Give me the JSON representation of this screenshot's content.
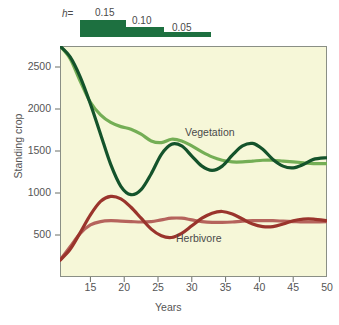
{
  "legend": {
    "h_prefix": "h",
    "equals": "=",
    "values": [
      "0.15",
      "0.10",
      "0.05"
    ],
    "bar_color": "#1d7040"
  },
  "chart_data": {
    "type": "line",
    "title": "",
    "xlabel": "Years",
    "ylabel": "Standing crop",
    "xlim": [
      10.5,
      50
    ],
    "ylim": [
      0,
      2750
    ],
    "xticks": [
      15,
      20,
      25,
      30,
      35,
      40,
      45,
      50
    ],
    "yticks": [
      500,
      1000,
      1500,
      2000,
      2500
    ],
    "grid": false,
    "legend_position": "inline-annotation",
    "plot_background": "#f6f7d8",
    "annotations": [
      {
        "text": "Vegetation",
        "x": 32,
        "y": 1700
      },
      {
        "text": "Herbivore",
        "x": 30,
        "y": 430
      }
    ],
    "series": [
      {
        "name": "Vegetation h=0.05",
        "color": "#14532b",
        "x": [
          10.5,
          12,
          13.5,
          15,
          16.5,
          18,
          19.5,
          21,
          22.5,
          24,
          25.5,
          27,
          28.5,
          30,
          31.5,
          33,
          34.5,
          36,
          37.5,
          39,
          40.5,
          42,
          43.5,
          45,
          46.5,
          48,
          50
        ],
        "values": [
          2750,
          2620,
          2380,
          2060,
          1700,
          1340,
          1080,
          980,
          1040,
          1230,
          1460,
          1580,
          1560,
          1440,
          1320,
          1270,
          1320,
          1450,
          1560,
          1590,
          1520,
          1400,
          1320,
          1300,
          1340,
          1400,
          1420
        ]
      },
      {
        "name": "Vegetation h=0.15",
        "color": "#74ae55",
        "x": [
          10.5,
          12,
          13.5,
          15,
          16.5,
          18,
          19.5,
          21,
          22.5,
          24,
          25.5,
          27,
          28.5,
          30,
          31.5,
          33,
          34.5,
          36,
          37.5,
          39,
          40.5,
          42,
          43.5,
          45,
          46.5,
          48,
          50
        ],
        "values": [
          2750,
          2600,
          2330,
          2080,
          1930,
          1840,
          1790,
          1760,
          1700,
          1620,
          1600,
          1640,
          1620,
          1560,
          1490,
          1430,
          1390,
          1370,
          1370,
          1380,
          1390,
          1390,
          1380,
          1370,
          1360,
          1350,
          1350
        ]
      },
      {
        "name": "Herbivore h=0.05",
        "color": "#9a342c",
        "x": [
          10.5,
          12,
          13.5,
          15,
          16.5,
          18,
          19.5,
          21,
          22.5,
          24,
          25.5,
          27,
          28.5,
          30,
          31.5,
          33,
          34.5,
          36,
          37.5,
          39,
          40.5,
          42,
          43.5,
          45,
          46.5,
          48,
          50
        ],
        "values": [
          200,
          330,
          530,
          740,
          900,
          960,
          930,
          830,
          700,
          570,
          490,
          470,
          520,
          610,
          700,
          760,
          780,
          750,
          690,
          630,
          600,
          600,
          630,
          670,
          690,
          690,
          670
        ]
      },
      {
        "name": "Herbivore h=0.15",
        "color": "#b5635c",
        "x": [
          10.5,
          12,
          13.5,
          15,
          16.5,
          18,
          19.5,
          21,
          22.5,
          24,
          25.5,
          27,
          28.5,
          30,
          31.5,
          33,
          34.5,
          36,
          37.5,
          39,
          40.5,
          42,
          43.5,
          45,
          46.5,
          48,
          50
        ],
        "values": [
          200,
          360,
          520,
          620,
          660,
          670,
          665,
          660,
          655,
          660,
          680,
          700,
          700,
          680,
          660,
          650,
          650,
          655,
          665,
          670,
          672,
          670,
          665,
          660,
          655,
          655,
          658
        ]
      }
    ]
  }
}
